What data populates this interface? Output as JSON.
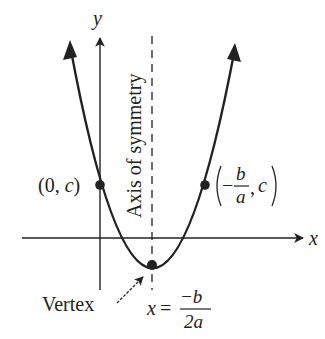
{
  "diagram": {
    "type": "parabola",
    "axes": {
      "x_label": "x",
      "y_label": "y"
    },
    "axis_of_symmetry": {
      "label": "Axis of symmetry",
      "equation_lhs": "x =",
      "equation_numerator": "−b",
      "equation_denominator": "2a"
    },
    "points": {
      "y_intercept": {
        "open": "(0, ",
        "var": "c",
        "close": ")"
      },
      "mirror_point": {
        "minus": "−",
        "numerator": "b",
        "denominator": "a",
        "sep": ",",
        "var": "c"
      },
      "vertex": {
        "label": "Vertex"
      }
    },
    "colors": {
      "ink": "#222222",
      "background": "#ffffff"
    }
  }
}
